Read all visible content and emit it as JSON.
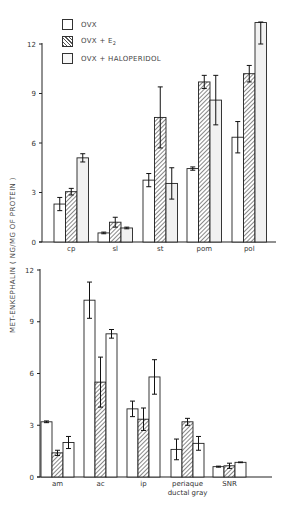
{
  "figure": {
    "ylabel": "MET-ENKEPHALIN ( NG/MG OF PROTEIN )",
    "legend": [
      {
        "label": "OVX",
        "fill": "white"
      },
      {
        "label": "OVX + E",
        "subscript": "2",
        "fill": "hatched"
      },
      {
        "label": "OVX + HALOPERIDOL",
        "fill": "light"
      }
    ],
    "colors": {
      "line": "#222222",
      "hatch": "#555555",
      "light_fill": "#f1f1f1",
      "white_fill": "#ffffff"
    }
  },
  "chart_data": [
    {
      "type": "bar",
      "title": "",
      "xlabel": "",
      "ylabel": "MET-ENKEPHALIN ( NG/MG OF PROTEIN )",
      "ylim": [
        0,
        12
      ],
      "yticks": [
        0,
        3,
        6,
        9,
        12
      ],
      "grid": false,
      "legend_position": "top-left",
      "categories": [
        "cp",
        "sl",
        "st",
        "pom",
        "pol"
      ],
      "series": [
        {
          "name": "OVX",
          "values": [
            2.3,
            0.55,
            3.75,
            4.45,
            6.35
          ],
          "errors": [
            0.4,
            0.05,
            0.4,
            0.1,
            0.95
          ]
        },
        {
          "name": "OVX + E2",
          "values": [
            3.05,
            1.2,
            7.55,
            9.7,
            10.2
          ],
          "errors": [
            0.2,
            0.3,
            1.85,
            0.4,
            0.5
          ]
        },
        {
          "name": "OVX + HALOPERIDOL",
          "values": [
            5.1,
            0.85,
            3.55,
            8.6,
            13.3
          ],
          "errors": [
            0.25,
            0.05,
            0.95,
            1.5,
            1.3
          ]
        }
      ]
    },
    {
      "type": "bar",
      "title": "",
      "xlabel": "",
      "ylabel": "MET-ENKEPHALIN ( NG/MG OF PROTEIN )",
      "ylim": [
        0,
        12
      ],
      "yticks": [
        0,
        3,
        6,
        9,
        12
      ],
      "grid": false,
      "categories": [
        "am",
        "ac",
        "ip",
        "periaque ductal gray",
        "SNR"
      ],
      "category_lines": [
        [
          "am"
        ],
        [
          "ac"
        ],
        [
          "ip"
        ],
        [
          "periaque",
          "ductal gray"
        ],
        [
          "SNR"
        ]
      ],
      "series": [
        {
          "name": "OVX",
          "values": [
            3.2,
            10.25,
            3.95,
            1.6,
            0.6
          ],
          "errors": [
            0.05,
            1.05,
            0.45,
            0.6,
            0.03
          ]
        },
        {
          "name": "OVX + E2",
          "values": [
            1.4,
            5.5,
            3.35,
            3.2,
            0.65
          ],
          "errors": [
            0.15,
            1.45,
            0.65,
            0.2,
            0.15
          ]
        },
        {
          "name": "OVX + HALOPERIDOL",
          "values": [
            2.0,
            8.3,
            5.8,
            1.95,
            0.85
          ],
          "errors": [
            0.35,
            0.25,
            1.0,
            0.4,
            0.02
          ]
        }
      ]
    }
  ]
}
